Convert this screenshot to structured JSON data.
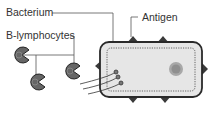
{
  "labels": {
    "bacterium": "Bacterium",
    "b_lymphocytes": "B-lymphocytes",
    "antigen": "Antigen"
  },
  "colors": {
    "outline": "#333333",
    "cell_fill": "#e6e6e6",
    "lymphocyte_fill": "#6a6a6a",
    "spike": "#3a3a3a",
    "nucleoid": "#9a9a9a",
    "line": "#555555"
  }
}
